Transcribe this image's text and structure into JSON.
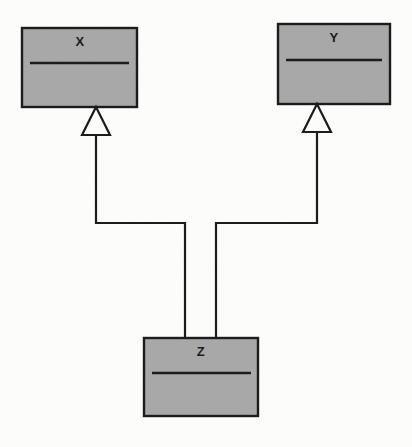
{
  "diagram": {
    "type": "uml-class-diagram",
    "title": "",
    "background_color": "#fdfdfc",
    "class_fill_color": "#a8a8a8",
    "stroke_color": "#1a1a1a",
    "classes": [
      {
        "id": "class-x",
        "name": "X",
        "x": 22,
        "y": 28,
        "width": 115,
        "height": 79,
        "divider_y": 63,
        "label_x": 80,
        "label_y": 36
      },
      {
        "id": "class-y",
        "name": "Y",
        "x": 278,
        "y": 24,
        "width": 112,
        "height": 80,
        "divider_y": 60,
        "label_x": 334,
        "label_y": 32
      },
      {
        "id": "class-z",
        "name": "Z",
        "x": 144,
        "y": 338,
        "width": 114,
        "height": 78,
        "divider_y": 373,
        "label_x": 201,
        "label_y": 345
      }
    ],
    "generalizations": [
      {
        "id": "gen-z-to-x",
        "from": "Z",
        "to": "X",
        "arrow_kind": "hollow-triangle",
        "triangle": {
          "apex_x": 96,
          "apex_y": 107,
          "left_x": 82,
          "right_x": 110,
          "base_y": 135
        },
        "path": "M 96 135 L 96 223 L 185 223 L 185 338"
      },
      {
        "id": "gen-z-to-y",
        "from": "Z",
        "to": "Y",
        "arrow_kind": "hollow-triangle",
        "triangle": {
          "apex_x": 317,
          "apex_y": 104,
          "left_x": 303,
          "right_x": 331,
          "base_y": 132
        },
        "path": "M 317 132 L 317 223 L 216 223 L 216 338"
      }
    ]
  }
}
